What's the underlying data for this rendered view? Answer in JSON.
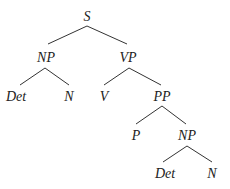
{
  "diagram": {
    "type": "syntax-tree",
    "nodes": {
      "s": "S",
      "np1": "NP",
      "vp": "VP",
      "det1": "Det",
      "n1": "N",
      "v": "V",
      "pp": "PP",
      "p": "P",
      "np2": "NP",
      "det2": "Det",
      "n2": "N"
    },
    "edges": [
      [
        "S",
        "NP"
      ],
      [
        "S",
        "VP"
      ],
      [
        "NP",
        "Det"
      ],
      [
        "NP",
        "N"
      ],
      [
        "VP",
        "V"
      ],
      [
        "VP",
        "PP"
      ],
      [
        "PP",
        "P"
      ],
      [
        "PP",
        "NP"
      ],
      [
        "NP",
        "Det"
      ],
      [
        "NP",
        "N"
      ]
    ]
  }
}
